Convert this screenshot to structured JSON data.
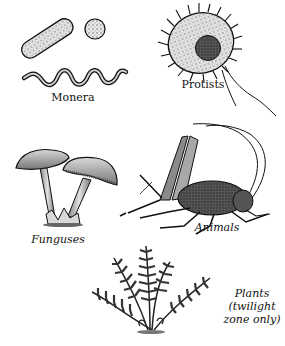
{
  "figure": {
    "groups": [
      {
        "id": "monera",
        "label": "Monera",
        "italic": false
      },
      {
        "id": "protists",
        "label": "Protists",
        "italic": false
      },
      {
        "id": "funguses",
        "label": "Funguses",
        "italic": true
      },
      {
        "id": "animals",
        "label": "Animals",
        "italic": true
      },
      {
        "id": "plants",
        "label_lines": [
          "Plants",
          "(twilight",
          "zone only)"
        ],
        "italic": true
      }
    ],
    "colors": {
      "ink": "#111111",
      "shade": "#6b6b6b",
      "light": "#bdbdbd",
      "background": "#ffffff"
    }
  }
}
